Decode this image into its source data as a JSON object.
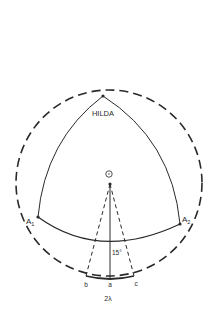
{
  "diagram": {
    "labels": {
      "top_vertex": "HILDA",
      "left_vertex": "A",
      "left_vertex_sub": "1",
      "right_vertex": "A",
      "right_vertex_sub": "2",
      "angle": "15°",
      "point_b": "b",
      "point_a": "a",
      "point_c": "c",
      "bottom": "2λ",
      "center_symbol": "sun"
    },
    "colors": {
      "line": "#2a2a2a",
      "background": "#ffffff"
    }
  }
}
